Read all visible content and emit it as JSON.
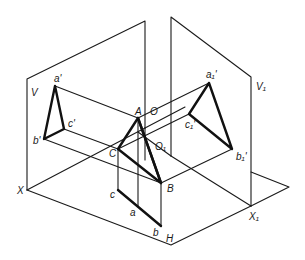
{
  "figure": {
    "type": "projection-diagram"
  },
  "colors": {
    "background": "#ffffff",
    "line": "#1a1a1a"
  },
  "labels": {
    "V": "V",
    "V1": "V₁",
    "H": "H",
    "X": "X",
    "X1": "X₁",
    "O": "O",
    "O1": "O₁",
    "A": "A",
    "B": "B",
    "C": "C",
    "a_prime": "a'",
    "b_prime": "b'",
    "c_prime": "c'",
    "a": "a",
    "b": "b",
    "c": "c",
    "a1_prime": "a₁'",
    "b1_prime": "b₁'",
    "c1_prime": "c₁'"
  },
  "points": {
    "X": [
      27,
      190
    ],
    "X1": [
      250,
      206
    ],
    "H_corner": [
      171,
      245
    ],
    "H1_tip": [
      289,
      187
    ],
    "V_top_left": [
      27,
      79
    ],
    "V_top_right": [
      145,
      21
    ],
    "V1_top_left": [
      171,
      17
    ],
    "V1_top_right": [
      251,
      77
    ],
    "A": [
      138,
      118
    ],
    "B": [
      161,
      183
    ],
    "C": [
      118,
      149
    ],
    "a_prime": [
      55,
      86
    ],
    "b_prime": [
      44,
      139
    ],
    "c_prime": [
      64,
      129
    ],
    "a": [
      138,
      207
    ],
    "b": [
      161,
      226
    ],
    "c": [
      118,
      190
    ],
    "a1_prime": [
      209,
      83
    ],
    "b1_prime": [
      232,
      149
    ],
    "c1_prime": [
      189,
      114
    ],
    "O": [
      155,
      118
    ],
    "O1": [
      160,
      140
    ]
  }
}
